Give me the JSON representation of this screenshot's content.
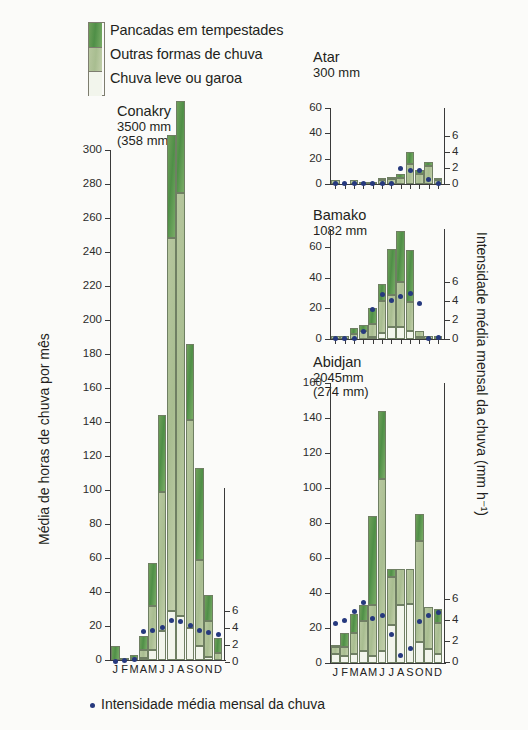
{
  "legend": {
    "items": [
      {
        "label": "Pancadas em tempestades",
        "color": "#5b9650"
      },
      {
        "label": "Outras formas de chuva",
        "color": "#b2c39a"
      },
      {
        "label": "Chuva leve ou garoa",
        "color": "#f2f5ec"
      }
    ]
  },
  "axes": {
    "left_caption": "Média de horas de chuva por mês",
    "right_caption": "Intensidade média mensal da chuva (mm h⁻¹)",
    "bottom_caption": "Intensidade média mensal da chuva",
    "dot_color": "#26397e"
  },
  "months": [
    "J",
    "F",
    "M",
    "A",
    "M",
    "J",
    "J",
    "A",
    "S",
    "O",
    "N",
    "D"
  ],
  "chart_data": [
    {
      "type": "bar",
      "title": "Conakry",
      "subtitle_lines": [
        "3500 mm",
        "(358 mm)"
      ],
      "annual_rain_mm": 3500,
      "wettest_month_mm": 358,
      "xlabel": "",
      "ylabel": "Média de horas de chuva por mês",
      "ylim": [
        0,
        300
      ],
      "yticks": [
        0,
        20,
        40,
        60,
        80,
        100,
        120,
        140,
        160,
        180,
        200,
        220,
        240,
        260,
        280,
        300
      ],
      "y2label": "Intensidade média mensal da chuva (mm h-1)",
      "y2lim": [
        0,
        7
      ],
      "y2ticks": [
        0,
        2,
        4,
        6
      ],
      "categories": [
        "J",
        "F",
        "M",
        "A",
        "M",
        "J",
        "J",
        "A",
        "S",
        "O",
        "N",
        "D"
      ],
      "series": [
        {
          "name": "Chuva leve ou garoa",
          "values": [
            0,
            0,
            0,
            1,
            6,
            17,
            29,
            26,
            19,
            8,
            2,
            0
          ]
        },
        {
          "name": "Outras formas de chuva",
          "values": [
            0,
            0,
            1,
            5,
            26,
            82,
            219,
            249,
            122,
            51,
            21,
            4
          ]
        },
        {
          "name": "Pancadas em tempestades",
          "values": [
            8,
            1,
            2,
            8,
            25,
            45,
            61,
            54,
            45,
            54,
            15,
            9
          ]
        }
      ],
      "totals": [
        8,
        1,
        3,
        13,
        51,
        127,
        280,
        303,
        167,
        105,
        36,
        13
      ],
      "intensity": [
        0.1,
        0.2,
        0.3,
        3.6,
        3.7,
        4.0,
        4.8,
        4.7,
        4.3,
        3.7,
        3.4,
        3.2
      ]
    },
    {
      "type": "bar",
      "title": "Atar",
      "subtitle_lines": [
        "300 mm"
      ],
      "annual_rain_mm": 300,
      "ylim": [
        0,
        60
      ],
      "yticks": [
        0,
        20,
        40,
        60
      ],
      "y2lim": [
        0,
        7
      ],
      "y2ticks": [
        0,
        2,
        4,
        6
      ],
      "categories": [
        "J",
        "F",
        "M",
        "A",
        "M",
        "J",
        "J",
        "A",
        "S",
        "O",
        "N",
        "D"
      ],
      "series": [
        {
          "name": "Chuva leve ou garoa",
          "values": [
            0,
            0,
            0,
            0,
            0,
            0,
            0,
            0,
            0,
            0,
            0,
            0
          ]
        },
        {
          "name": "Outras formas de chuva",
          "values": [
            3,
            0,
            3,
            1,
            1,
            3,
            4,
            5,
            16,
            8,
            14,
            3
          ]
        },
        {
          "name": "Pancadas em tempestades",
          "values": [
            0,
            0,
            0,
            0,
            0,
            2,
            1,
            3,
            9,
            3,
            3,
            1
          ]
        }
      ],
      "totals": [
        3,
        0,
        3,
        1,
        1,
        5,
        5,
        8,
        25,
        11,
        17,
        4
      ],
      "intensity": [
        0.1,
        0.1,
        0.1,
        0.1,
        0.1,
        0.1,
        0.1,
        2.0,
        1.7,
        1.7,
        0.6,
        0.1
      ]
    },
    {
      "type": "bar",
      "title": "Bamako",
      "subtitle_lines": [
        "1082 mm"
      ],
      "annual_rain_mm": 1082,
      "ylim": [
        0,
        72
      ],
      "yticks": [
        0,
        20,
        40,
        60
      ],
      "y2lim": [
        0,
        7
      ],
      "y2ticks": [
        0,
        2,
        4,
        6
      ],
      "categories": [
        "J",
        "F",
        "M",
        "A",
        "M",
        "J",
        "J",
        "A",
        "S",
        "O",
        "N",
        "D"
      ],
      "series": [
        {
          "name": "Chuva leve ou garoa",
          "values": [
            0,
            0,
            0,
            0,
            1,
            4,
            8,
            8,
            5,
            1,
            0,
            0
          ]
        },
        {
          "name": "Outras formas de chuva",
          "values": [
            2,
            2,
            3,
            5,
            9,
            21,
            21,
            29,
            19,
            4,
            2,
            0
          ]
        },
        {
          "name": "Pancadas em tempestades",
          "values": [
            0,
            0,
            4,
            4,
            10,
            11,
            30,
            34,
            34,
            0,
            0,
            2
          ]
        }
      ],
      "totals": [
        2,
        2,
        7,
        9,
        20,
        36,
        59,
        71,
        58,
        5,
        2,
        2
      ],
      "intensity": [
        0.1,
        0.1,
        0.1,
        0.8,
        3.1,
        4.7,
        4.1,
        4.5,
        4.8,
        3.8,
        0.1,
        0.2
      ]
    },
    {
      "type": "bar",
      "title": "Abidjan",
      "subtitle_lines": [
        "2045mm",
        "(274 mm)"
      ],
      "annual_rain_mm": 2045,
      "wettest_month_mm": 274,
      "ylim": [
        0,
        160
      ],
      "yticks": [
        0,
        20,
        40,
        60,
        80,
        100,
        120,
        140,
        160
      ],
      "y2lim": [
        0,
        7
      ],
      "y2ticks": [
        0,
        2,
        4,
        6
      ],
      "categories": [
        "J",
        "F",
        "M",
        "A",
        "M",
        "J",
        "J",
        "A",
        "S",
        "O",
        "N",
        "D"
      ],
      "series": [
        {
          "name": "Chuva leve ou garoa",
          "values": [
            5,
            4,
            5,
            7,
            4,
            7,
            22,
            33,
            34,
            12,
            8,
            5
          ]
        },
        {
          "name": "Outras formas de chuva",
          "values": [
            4,
            5,
            12,
            17,
            29,
            98,
            27,
            21,
            20,
            58,
            24,
            18
          ]
        },
        {
          "name": "Pancadas em tempestades",
          "values": [
            1,
            8,
            11,
            9,
            51,
            39,
            5,
            0,
            0,
            15,
            0,
            8
          ]
        }
      ],
      "totals": [
        10,
        17,
        28,
        33,
        84,
        144,
        54,
        54,
        54,
        85,
        32,
        31
      ],
      "intensity": [
        3.6,
        3.9,
        4.8,
        5.6,
        4.1,
        4.4,
        2.6,
        0.6,
        1.3,
        3.8,
        4.4,
        4.7
      ]
    }
  ]
}
